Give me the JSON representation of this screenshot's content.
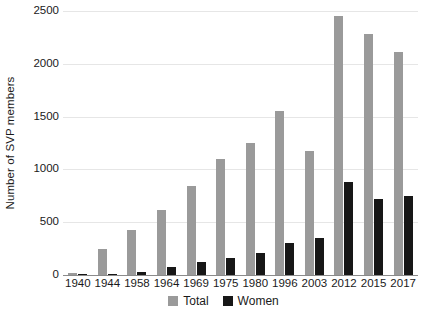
{
  "chart_data": {
    "type": "bar",
    "title": "",
    "subtitle": "",
    "xlabel": "",
    "ylabel": "Number of SVP members",
    "ylim": [
      0,
      2500
    ],
    "yticks": [
      0,
      500,
      1000,
      1500,
      2000,
      2500
    ],
    "ytick_labels": [
      "0",
      "500",
      "1000",
      "1500",
      "2000",
      "2500"
    ],
    "grid": true,
    "legend_position": "bottom",
    "categories": [
      "1940",
      "1944",
      "1958",
      "1964",
      "1969",
      "1975",
      "1980",
      "1996",
      "2003",
      "2012",
      "2015",
      "2017"
    ],
    "series": [
      {
        "name": "Total",
        "color": "#9a9a9a",
        "values": [
          15,
          250,
          430,
          620,
          840,
          1100,
          1250,
          1550,
          1170,
          2450,
          2280,
          2110
        ]
      },
      {
        "name": "Women",
        "color": "#171717",
        "values": [
          2,
          10,
          25,
          80,
          120,
          160,
          210,
          300,
          350,
          880,
          720,
          750
        ]
      }
    ]
  },
  "legend": {
    "items": [
      {
        "label": "Total",
        "color": "#9a9a9a"
      },
      {
        "label": "Women",
        "color": "#171717"
      }
    ]
  },
  "colors": {
    "total": "#9a9a9a",
    "women": "#171717",
    "gridline": "#e6e6e6",
    "axis": "#8a8a8a",
    "text": "#1a1a1a",
    "background": "#ffffff"
  }
}
